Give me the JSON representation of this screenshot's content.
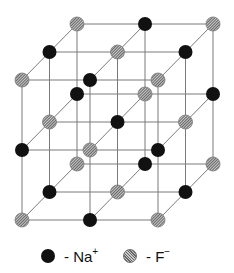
{
  "diagram": {
    "lattice": {
      "size": [
        3,
        3,
        3
      ],
      "origin": [
        22,
        80
      ],
      "step_x": 68,
      "step_y": 70,
      "depth_dx": 27.5,
      "depth_dy": -28,
      "atom_radius": 7,
      "parity_rule": "Na where (i+j+k) odd, F where (i+j+k) even; top-front-left = F"
    },
    "colors": {
      "na": "#111111",
      "f": "#9a9a9a",
      "f_hatch_dark": "#666666",
      "f_hatch_light": "#c8c8c8",
      "bond": "#7a7a7a",
      "background": "#ffffff"
    }
  },
  "legend": {
    "items": [
      {
        "id": "na",
        "symbol": "Na",
        "charge": "+",
        "prefix": "- "
      },
      {
        "id": "f",
        "symbol": "F",
        "charge": "−",
        "prefix": "- "
      }
    ]
  }
}
